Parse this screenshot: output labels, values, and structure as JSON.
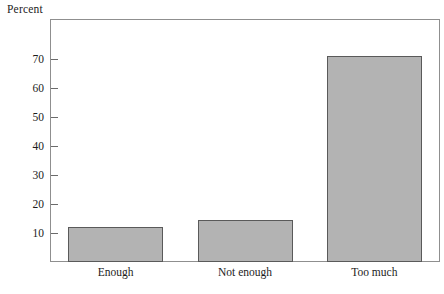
{
  "chart_data": {
    "type": "bar",
    "title": "",
    "ylabel": "Percent",
    "xlabel": "",
    "categories": [
      "Enough",
      "Not enough",
      "Too much"
    ],
    "values": [
      12,
      14.5,
      71
    ],
    "ylim": [
      0,
      80
    ],
    "yticks": [
      10,
      20,
      30,
      40,
      50,
      60,
      70
    ],
    "ytick_labels": [
      "10",
      "20",
      "30",
      "40",
      "50",
      "60",
      "70"
    ],
    "grid": false,
    "legend": null,
    "bar_color": "#b3b3b3",
    "bar_border_color": "#5a5a5a",
    "frame_color": "#8f8f8f",
    "text_color": "#1c1c1c",
    "background": "#ffffff"
  },
  "axis": {
    "y_title": "Percent"
  }
}
